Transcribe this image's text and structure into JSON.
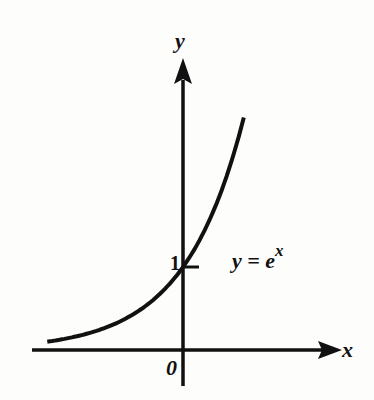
{
  "chart_data": {
    "type": "line",
    "title": "",
    "xlabel": "x",
    "ylabel": "y",
    "function": "y = e^x",
    "series": [
      {
        "name": "y = e^x",
        "x": [
          -2.3,
          -2.0,
          -1.5,
          -1.0,
          -0.5,
          0.0,
          0.25,
          0.5,
          0.75,
          1.0,
          1.03
        ],
        "values": [
          0.1,
          0.135,
          0.223,
          0.368,
          0.607,
          1.0,
          1.284,
          1.649,
          2.117,
          2.718,
          2.8
        ]
      }
    ],
    "annotations": [
      {
        "text": "1",
        "x": 0,
        "y": 1,
        "note": "y-intercept tick"
      },
      {
        "text": "0",
        "x": 0,
        "y": 0,
        "note": "origin"
      },
      {
        "text": "y = e^x",
        "note": "curve label"
      }
    ],
    "xlim": [
      -2.5,
      2.6
    ],
    "ylim": [
      -0.4,
      3.5
    ],
    "grid": false,
    "legend": "none",
    "colors": {
      "line": "#111111",
      "axes": "#111111",
      "background": "#fdfdfb"
    }
  },
  "labels": {
    "y_axis": "y",
    "x_axis": "x",
    "origin": "0",
    "tick_one": "1",
    "equation_base": "y = e",
    "equation_exponent": "x"
  }
}
